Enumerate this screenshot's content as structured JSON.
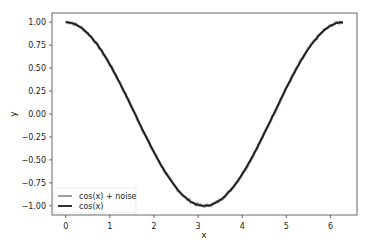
{
  "chart_data": {
    "type": "line",
    "title": "",
    "xlabel": "x",
    "ylabel": "y",
    "xlim": [
      -0.31,
      6.6
    ],
    "ylim": [
      -1.1,
      1.1
    ],
    "xticks": [
      0,
      1,
      2,
      3,
      4,
      5,
      6
    ],
    "yticks": [
      1.0,
      0.75,
      0.5,
      0.25,
      0.0,
      -0.25,
      -0.5,
      -0.75,
      -1.0
    ],
    "ytick_labels": [
      "1.00",
      "0.75",
      "0.50",
      "0.25",
      "0.00",
      "−0.25",
      "−0.50",
      "−0.75",
      "−1.00"
    ],
    "grid": false,
    "legend_position": "lower left",
    "series": [
      {
        "name": "cos(x) + noise",
        "color": "#7f7f7f",
        "function": "cos(x)+noise",
        "x_range": [
          0,
          6.283
        ]
      },
      {
        "name": "cos(x)",
        "color": "#1a1a1a",
        "function": "cos(x)",
        "x_range": [
          0,
          6.283
        ]
      }
    ]
  },
  "legend": {
    "items": [
      {
        "label": "cos(x) + noise",
        "color": "#7f7f7f"
      },
      {
        "label": "cos(x)",
        "color": "#1a1a1a"
      }
    ]
  }
}
